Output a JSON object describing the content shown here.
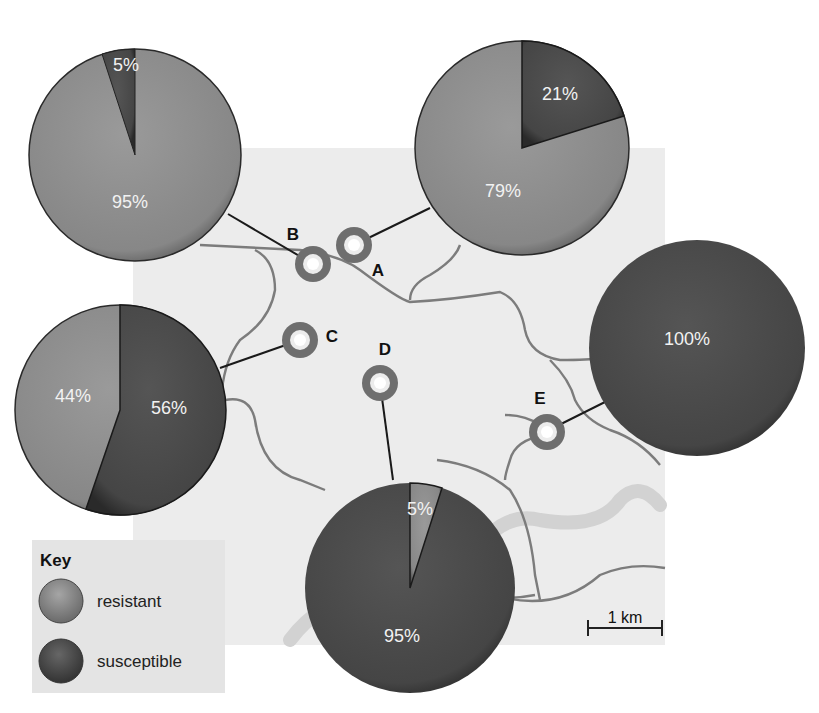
{
  "colors": {
    "resistant": "#8a8a8a",
    "susceptible": "#4a4a4a",
    "map_bg": "#ececec",
    "river": "#7a7a7a",
    "wide_river": "#cfcfcf",
    "marker": "#6e6e6e"
  },
  "sites": [
    {
      "id": "A",
      "label": "A",
      "resistant_pct": 79,
      "susceptible_pct": 21,
      "resistant_label": "79%",
      "susceptible_label": "21%"
    },
    {
      "id": "B",
      "label": "B",
      "resistant_pct": 95,
      "susceptible_pct": 5,
      "resistant_label": "95%",
      "susceptible_label": "5%"
    },
    {
      "id": "C",
      "label": "C",
      "resistant_pct": 44,
      "susceptible_pct": 56,
      "resistant_label": "44%",
      "susceptible_label": "56%"
    },
    {
      "id": "D",
      "label": "D",
      "resistant_pct": 5,
      "susceptible_pct": 95,
      "resistant_label": "5%",
      "susceptible_label": "95%"
    },
    {
      "id": "E",
      "label": "E",
      "resistant_pct": 0,
      "susceptible_pct": 100,
      "resistant_label": "",
      "susceptible_label": "100%"
    }
  ],
  "key": {
    "title": "Key",
    "items": [
      {
        "label": "resistant"
      },
      {
        "label": "susceptible"
      }
    ]
  },
  "scale_bar": {
    "label": "1 km"
  }
}
